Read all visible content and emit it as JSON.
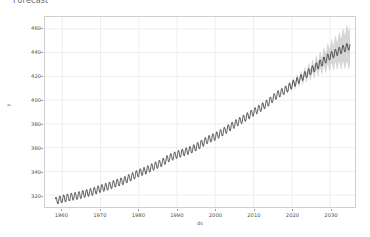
{
  "header": {
    "clipped_text": "Forecast"
  },
  "chart_data": {
    "type": "line",
    "title": "",
    "xlabel": "ds",
    "ylabel": "y",
    "grid": true,
    "legend": "none",
    "xlim": [
      1955.5,
      2036.5
    ],
    "ylim": [
      310,
      470
    ],
    "xticks": [
      1960,
      1970,
      1980,
      1990,
      2000,
      2010,
      2020,
      2030
    ],
    "xtick_labels": [
      "1960",
      "1970",
      "1980",
      "1990",
      "2000",
      "2010",
      "2020",
      "2030"
    ],
    "yticks": [
      320,
      340,
      360,
      380,
      400,
      420,
      440,
      460
    ],
    "ytick_labels": [
      "320",
      "340",
      "360",
      "380",
      "400",
      "420",
      "440",
      "460"
    ],
    "history_range": [
      1958.2,
      2018.3
    ],
    "forecast_range": [
      2018.3,
      2035.2
    ],
    "seasonal_amplitude": 3.2,
    "colors": {
      "line": "#1b1b1b",
      "uncertainty_band": "#b4b4b4",
      "grid": "#ececec",
      "frame": "#cfcfcf",
      "tick_text": "#4d4d4d"
    },
    "series": [
      {
        "name": "yhat",
        "x": [
          1958.2,
          1960,
          1962,
          1964,
          1966,
          1968,
          1970,
          1972,
          1974,
          1976,
          1978,
          1980,
          1982,
          1984,
          1986,
          1988,
          1990,
          1992,
          1994,
          1996,
          1998,
          2000,
          2002,
          2004,
          2006,
          2008,
          2010,
          2012,
          2014,
          2016,
          2018.3,
          2020,
          2022,
          2024,
          2026,
          2028,
          2030,
          2032,
          2034,
          2035.2
        ],
        "values": [
          315.0,
          316.8,
          318.3,
          319.5,
          321.3,
          323.0,
          325.5,
          327.4,
          330.0,
          332.0,
          335.2,
          338.6,
          341.0,
          344.3,
          347.2,
          351.4,
          354.1,
          356.3,
          358.7,
          362.4,
          366.6,
          369.4,
          373.2,
          377.5,
          381.7,
          385.5,
          389.8,
          393.8,
          398.4,
          404.1,
          408.5,
          412.7,
          417.5,
          422.4,
          427.3,
          432.2,
          437.2,
          440.8,
          444.1,
          445.5
        ]
      },
      {
        "name": "yhat_lower",
        "x": [
          2018.3,
          2020,
          2022,
          2024,
          2026,
          2028,
          2030,
          2032,
          2034,
          2035.2
        ],
        "values": [
          407.6,
          411.0,
          414.6,
          418.2,
          421.6,
          424.8,
          427.6,
          428.9,
          429.4,
          428.8
        ]
      },
      {
        "name": "yhat_upper",
        "x": [
          2018.3,
          2020,
          2022,
          2024,
          2026,
          2028,
          2030,
          2032,
          2034,
          2035.2
        ],
        "values": [
          409.4,
          414.6,
          420.5,
          426.7,
          433.2,
          439.8,
          446.9,
          452.8,
          458.9,
          462.2
        ]
      }
    ],
    "annotations": []
  }
}
